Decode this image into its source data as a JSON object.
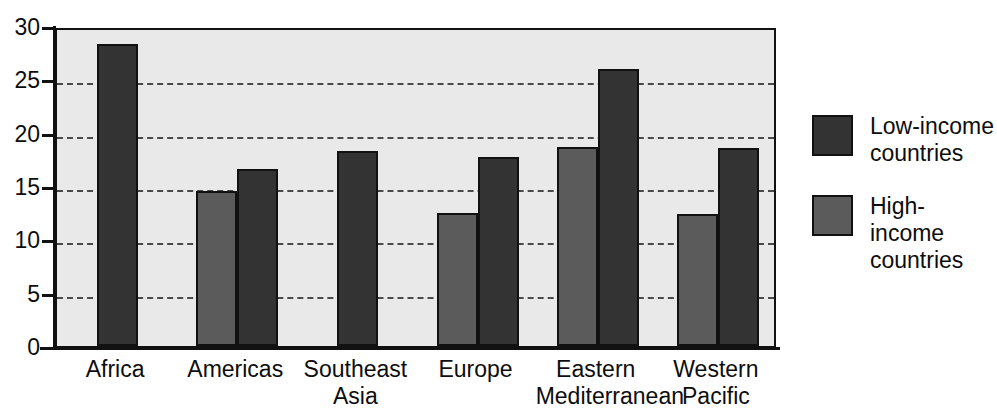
{
  "chart_data": {
    "type": "bar",
    "title": "",
    "subtitle": "",
    "xlabel": "",
    "ylabel": "",
    "ylim": [
      0,
      30
    ],
    "ytick_labels": [
      "30",
      "25",
      "20",
      "15",
      "10",
      "5",
      "0"
    ],
    "ytick_values": [
      30,
      25,
      20,
      15,
      10,
      5,
      0
    ],
    "grid": "horizontal-dashed",
    "legend_position": "right",
    "categories": [
      "Africa",
      "Americas",
      "Southeast\nAsia",
      "Europe",
      "Eastern\nMediterranean",
      "Western\nPacific"
    ],
    "series": [
      {
        "name": "High-income countries",
        "color": "#5b5b5b",
        "values": [
          null,
          14.5,
          null,
          12.5,
          18.7,
          12.4
        ]
      },
      {
        "name": "Low-income countries",
        "color": "#333333",
        "values": [
          28.3,
          16.6,
          18.3,
          17.7,
          26.0,
          18.6
        ]
      }
    ]
  },
  "legend": {
    "entries": [
      {
        "label": "Low-income\ncountries",
        "swatch": "#333333",
        "swatch_name": "low-income-swatch"
      },
      {
        "label": "High-income\ncountries",
        "swatch": "#5b5b5b",
        "swatch_name": "high-income-swatch"
      }
    ]
  },
  "colors": {
    "plot_background": "#e9e9e9",
    "axis": "#111111",
    "gridline": "#4a4a4a",
    "low_income": "#333333",
    "high_income": "#5b5b5b",
    "text": "#0d0d0d",
    "page_background": "#ffffff"
  }
}
